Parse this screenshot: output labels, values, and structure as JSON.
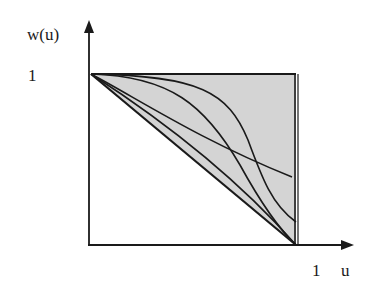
{
  "diagram": {
    "y_axis_label": "w(u)",
    "y_tick_label": "1",
    "x_tick_label": "1",
    "x_axis_label": "u",
    "colors": {
      "line": "#1a1a1a",
      "shade": "#d4d4d4",
      "background": "#ffffff"
    },
    "shaded_region": "triangle between diagonal w=1-u, top edge w=1 and right edge u=1",
    "curves": [
      {
        "name": "diagonal",
        "description": "straight line from (0,1) to (1,0)"
      },
      {
        "name": "near-linear-curve",
        "description": "slightly convex curve from (0,1) to (1,0)"
      },
      {
        "name": "s-curve-steep",
        "description": "S-shaped curve from (0,1) to (1,0)"
      },
      {
        "name": "s-curve-high",
        "description": "S-shaped curve from (0,1) ending near (1,0.13)"
      },
      {
        "name": "flat-curve",
        "description": "gently decreasing curve from (0,1) ending near (0.98,0.4)"
      }
    ]
  }
}
